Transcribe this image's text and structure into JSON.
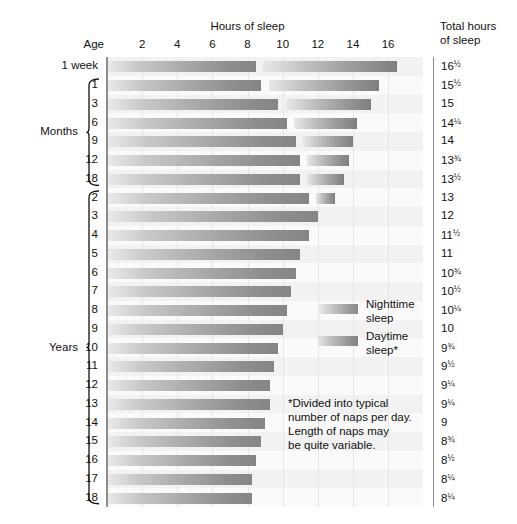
{
  "header": {
    "hours_title": "Hours of sleep",
    "age_title": "Age",
    "total_title_line1": "Total hours",
    "total_title_line2": "of sleep"
  },
  "axis": {
    "ticks": [
      2,
      4,
      6,
      8,
      10,
      12,
      14,
      16
    ],
    "min": 0,
    "max": 18,
    "unit": "hours"
  },
  "groups": {
    "months_label": "Months",
    "years_label": "Years"
  },
  "legend": {
    "nighttime_line1": "Nighttime",
    "nighttime_line2": "sleep",
    "daytime_line1": "Daytime",
    "daytime_line2": "sleep*"
  },
  "footnote": {
    "line1": "*Divided into typical",
    "line2": "number of naps per day.",
    "line3": "Length of naps may",
    "line4": "be quite variable."
  },
  "colors": {
    "night_start": "#eaeaea",
    "night_end": "#858585",
    "day_start": "#e8e8e8",
    "day_end": "#7e7e7e",
    "plot_bg": "#fbfbfb",
    "gridline": "#e6e6e6",
    "axis": "#8d8d8d",
    "text": "#1a1a1a"
  },
  "chart_data": {
    "type": "bar",
    "title": "Hours of sleep",
    "xlabel": "Hours of sleep",
    "ylabel": "Age",
    "xlim": [
      0,
      18
    ],
    "grid": true,
    "legend_position": "inside-right",
    "orientation": "horizontal",
    "stacked_with_gap": true,
    "categories": [
      "1 week",
      "1",
      "3",
      "6",
      "9",
      "12",
      "18",
      "2",
      "3",
      "4",
      "5",
      "6",
      "7",
      "8",
      "9",
      "10",
      "11",
      "12",
      "13",
      "14",
      "15",
      "16",
      "17",
      "18"
    ],
    "series": [
      {
        "name": "Nighttime sleep",
        "values": [
          8.5,
          8.75,
          9.75,
          10.25,
          10.75,
          11.0,
          11.0,
          11.5,
          12.0,
          11.5,
          11.0,
          10.75,
          10.5,
          10.25,
          10.0,
          9.75,
          9.5,
          9.25,
          9.25,
          9.0,
          8.75,
          8.5,
          8.25,
          8.25
        ]
      },
      {
        "name": "Daytime sleep",
        "values": [
          8.0,
          6.75,
          5.25,
          4.0,
          3.25,
          2.75,
          2.5,
          1.5,
          0,
          0,
          0,
          0,
          0,
          0,
          0,
          0,
          0,
          0,
          0,
          0,
          0,
          0,
          0,
          0
        ]
      }
    ],
    "rows": [
      {
        "age": "1 week",
        "group": "week",
        "night_start": 0.0,
        "night_end": 8.5,
        "day_start": 8.9,
        "day_end": 16.5,
        "total": "16½",
        "total_whole": "16",
        "total_frac": "½"
      },
      {
        "age": "1",
        "group": "months",
        "night_start": 0.0,
        "night_end": 8.75,
        "day_start": 9.2,
        "day_end": 15.5,
        "total": "15½",
        "total_whole": "15",
        "total_frac": "½"
      },
      {
        "age": "3",
        "group": "months",
        "night_start": 0.0,
        "night_end": 9.75,
        "day_start": 10.2,
        "day_end": 15.0,
        "total": "15",
        "total_whole": "15",
        "total_frac": ""
      },
      {
        "age": "6",
        "group": "months",
        "night_start": 0.0,
        "night_end": 10.25,
        "day_start": 10.65,
        "day_end": 14.25,
        "total": "14¼",
        "total_whole": "14",
        "total_frac": "¼"
      },
      {
        "age": "9",
        "group": "months",
        "night_start": 0.0,
        "night_end": 10.75,
        "day_start": 11.15,
        "day_end": 14.0,
        "total": "14",
        "total_whole": "14",
        "total_frac": ""
      },
      {
        "age": "12",
        "group": "months",
        "night_start": 0.0,
        "night_end": 11.0,
        "day_start": 11.4,
        "day_end": 13.75,
        "total": "13¾",
        "total_whole": "13",
        "total_frac": "¾"
      },
      {
        "age": "18",
        "group": "months",
        "night_start": 0.0,
        "night_end": 11.0,
        "day_start": 11.4,
        "day_end": 13.5,
        "total": "13½",
        "total_whole": "13",
        "total_frac": "½"
      },
      {
        "age": "2",
        "group": "years",
        "night_start": 0.0,
        "night_end": 11.5,
        "day_start": 11.9,
        "day_end": 13.0,
        "total": "13",
        "total_whole": "13",
        "total_frac": ""
      },
      {
        "age": "3",
        "group": "years",
        "night_start": 0.0,
        "night_end": 12.0,
        "day_start": 0,
        "day_end": 0,
        "total": "12",
        "total_whole": "12",
        "total_frac": ""
      },
      {
        "age": "4",
        "group": "years",
        "night_start": 0.0,
        "night_end": 11.5,
        "day_start": 0,
        "day_end": 0,
        "total": "11½",
        "total_whole": "11",
        "total_frac": "½"
      },
      {
        "age": "5",
        "group": "years",
        "night_start": 0.0,
        "night_end": 11.0,
        "day_start": 0,
        "day_end": 0,
        "total": "11",
        "total_whole": "11",
        "total_frac": ""
      },
      {
        "age": "6",
        "group": "years",
        "night_start": 0.0,
        "night_end": 10.75,
        "day_start": 0,
        "day_end": 0,
        "total": "10¾",
        "total_whole": "10",
        "total_frac": "¾"
      },
      {
        "age": "7",
        "group": "years",
        "night_start": 0.0,
        "night_end": 10.5,
        "day_start": 0,
        "day_end": 0,
        "total": "10½",
        "total_whole": "10",
        "total_frac": "½"
      },
      {
        "age": "8",
        "group": "years",
        "night_start": 0.0,
        "night_end": 10.25,
        "day_start": 0,
        "day_end": 0,
        "total": "10¼",
        "total_whole": "10",
        "total_frac": "¼"
      },
      {
        "age": "9",
        "group": "years",
        "night_start": 0.0,
        "night_end": 10.0,
        "day_start": 0,
        "day_end": 0,
        "total": "10",
        "total_whole": "10",
        "total_frac": ""
      },
      {
        "age": "10",
        "group": "years",
        "night_start": 0.0,
        "night_end": 9.75,
        "day_start": 0,
        "day_end": 0,
        "total": "9¾",
        "total_whole": "9",
        "total_frac": "¾"
      },
      {
        "age": "11",
        "group": "years",
        "night_start": 0.0,
        "night_end": 9.5,
        "day_start": 0,
        "day_end": 0,
        "total": "9½",
        "total_whole": "9",
        "total_frac": "½"
      },
      {
        "age": "12",
        "group": "years",
        "night_start": 0.0,
        "night_end": 9.25,
        "day_start": 0,
        "day_end": 0,
        "total": "9¼",
        "total_whole": "9",
        "total_frac": "¼"
      },
      {
        "age": "13",
        "group": "years",
        "night_start": 0.0,
        "night_end": 9.25,
        "day_start": 0,
        "day_end": 0,
        "total": "9¼",
        "total_whole": "9",
        "total_frac": "¼"
      },
      {
        "age": "14",
        "group": "years",
        "night_start": 0.0,
        "night_end": 9.0,
        "day_start": 0,
        "day_end": 0,
        "total": "9",
        "total_whole": "9",
        "total_frac": ""
      },
      {
        "age": "15",
        "group": "years",
        "night_start": 0.0,
        "night_end": 8.75,
        "day_start": 0,
        "day_end": 0,
        "total": "8¾",
        "total_whole": "8",
        "total_frac": "¾"
      },
      {
        "age": "16",
        "group": "years",
        "night_start": 0.0,
        "night_end": 8.5,
        "day_start": 0,
        "day_end": 0,
        "total": "8½",
        "total_whole": "8",
        "total_frac": "½"
      },
      {
        "age": "17",
        "group": "years",
        "night_start": 0.0,
        "night_end": 8.25,
        "day_start": 0,
        "day_end": 0,
        "total": "8¼",
        "total_whole": "8",
        "total_frac": "¼"
      },
      {
        "age": "18",
        "group": "years",
        "night_start": 0.0,
        "night_end": 8.25,
        "day_start": 0,
        "day_end": 0,
        "total": "8¼",
        "total_whole": "8",
        "total_frac": "¼"
      }
    ]
  }
}
